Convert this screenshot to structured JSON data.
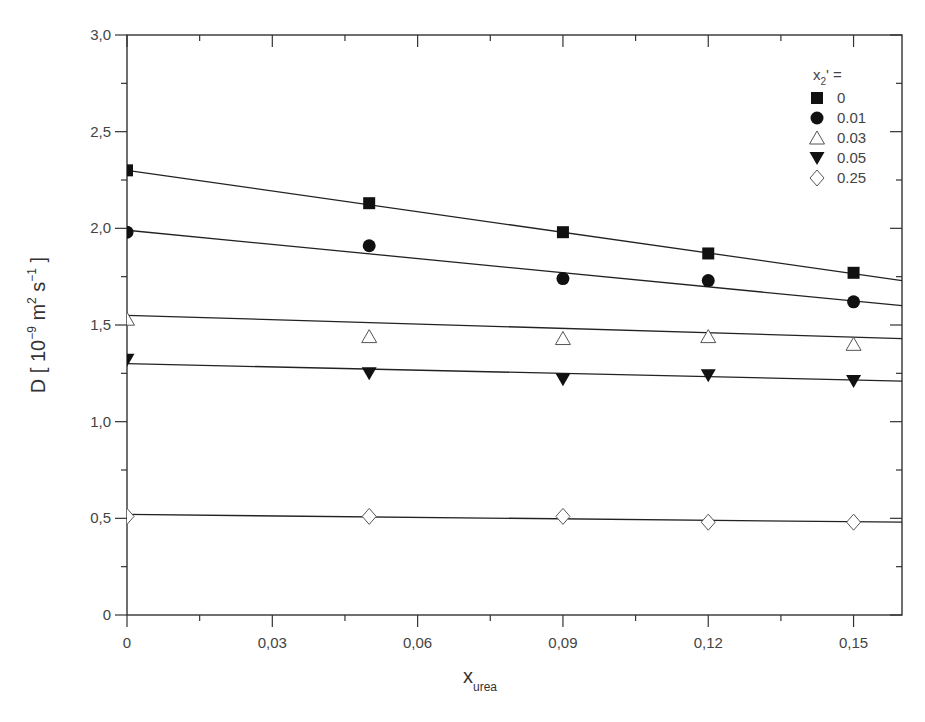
{
  "chart_data": {
    "type": "scatter",
    "title": "",
    "xlabel": "x",
    "xlabel_sub": "urea",
    "ylabel": "D [ 10",
    "ylabel_parts": {
      "main": "D [ 10",
      "exp1": "−9",
      "unit1": " m",
      "exp2": "2",
      "unit2": " s",
      "exp3": "−1",
      "close": " ]"
    },
    "xlim": [
      0,
      0.16
    ],
    "ylim": [
      0,
      3.0
    ],
    "x_ticks": [
      0,
      0.03,
      0.06,
      0.09,
      0.12,
      0.15
    ],
    "x_tick_labels": [
      "0",
      "0,03",
      "0,06",
      "0,09",
      "0,12",
      "0,15"
    ],
    "y_ticks": [
      0,
      0.5,
      1.0,
      1.5,
      2.0,
      2.5,
      3.0
    ],
    "y_tick_labels": [
      "0",
      "0,5",
      "1,0",
      "1,5",
      "2,0",
      "2,5",
      "3,0"
    ],
    "grid": false,
    "legend_position": "upper right",
    "legend_title": "x",
    "legend_title_sub": "2",
    "legend_title_suffix": "' =",
    "x": [
      0,
      0.05,
      0.09,
      0.12,
      0.15
    ],
    "series": [
      {
        "name": "0",
        "marker": "square-filled",
        "values": [
          2.3,
          2.13,
          1.98,
          1.87,
          1.77
        ],
        "fit": {
          "x0": 0,
          "y0": 2.3,
          "x1": 0.16,
          "y1": 1.73
        }
      },
      {
        "name": "0.01",
        "marker": "circle-filled",
        "values": [
          1.98,
          1.91,
          1.74,
          1.73,
          1.62
        ],
        "fit": {
          "x0": 0,
          "y0": 1.99,
          "x1": 0.16,
          "y1": 1.6
        }
      },
      {
        "name": "0.03",
        "marker": "triangle-up-open",
        "values": [
          1.53,
          1.44,
          1.43,
          1.44,
          1.4
        ],
        "fit": {
          "x0": 0,
          "y0": 1.55,
          "x1": 0.16,
          "y1": 1.43
        }
      },
      {
        "name": "0.05",
        "marker": "triangle-down-filled",
        "values": [
          1.32,
          1.25,
          1.22,
          1.24,
          1.21
        ],
        "fit": {
          "x0": 0,
          "y0": 1.3,
          "x1": 0.16,
          "y1": 1.21
        }
      },
      {
        "name": "0.25",
        "marker": "diamond-open",
        "values": [
          0.51,
          0.51,
          0.51,
          0.48,
          0.48
        ],
        "fit": {
          "x0": 0,
          "y0": 0.52,
          "x1": 0.16,
          "y1": 0.48
        }
      }
    ]
  },
  "labels": {
    "legend_header": "x",
    "legend_header_sub": "2",
    "legend_header_suffix": "' ="
  }
}
